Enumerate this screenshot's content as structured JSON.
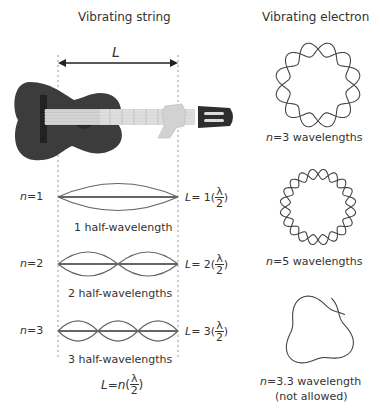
{
  "left_panel": {
    "title": "Vibrating string",
    "length_label": "L",
    "modes": [
      {
        "n_label": "n",
        "n_eq": "=1",
        "caption": "1 half-wavelength",
        "eq_L": "L",
        "eq_mid": "= 1(",
        "eq_num": "λ",
        "eq_den": "2",
        "eq_close": ")"
      },
      {
        "n_label": "n",
        "n_eq": "=2",
        "caption": "2 half-wavelengths",
        "eq_L": "L",
        "eq_mid": "= 2(",
        "eq_num": "λ",
        "eq_den": "2",
        "eq_close": ")"
      },
      {
        "n_label": "n",
        "n_eq": "=3",
        "caption": "3 half-wavelengths",
        "eq_L": "L",
        "eq_mid": "= 3(",
        "eq_num": "λ",
        "eq_den": "2",
        "eq_close": ")"
      }
    ],
    "general_eq": {
      "L": "L",
      "mid": "=",
      "n": "n",
      "open": "(",
      "num": "λ",
      "den": "2",
      "close": ")"
    }
  },
  "right_panel": {
    "title": "Vibrating electron",
    "orbits": [
      {
        "n_label": "n",
        "caption": "=3 wavelengths"
      },
      {
        "n_label": "n",
        "caption": "=5 wavelengths"
      },
      {
        "n_label": "n",
        "caption": "=3.3 wavelength",
        "note": "(not allowed)"
      }
    ]
  },
  "colors": {
    "line": "#555555",
    "guitar_body": "#3c3c3c",
    "text": "#333333"
  }
}
